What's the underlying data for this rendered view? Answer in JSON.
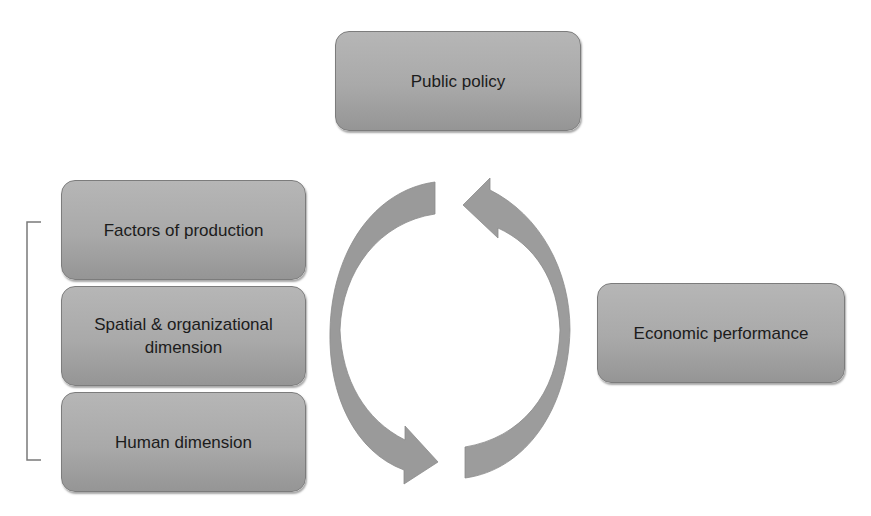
{
  "diagram": {
    "nodes": {
      "public_policy": "Public policy",
      "factors_of_production": "Factors of production",
      "spatial_organizational": "Spatial & organizational dimension",
      "human_dimension": "Human dimension",
      "economic_performance": "Economic performance"
    },
    "bracket_group": [
      "Factors of production",
      "Spatial & organizational dimension",
      "Human dimension"
    ],
    "cycle": {
      "arrows": [
        "left arrow: top to bottom (clockwise down)",
        "right arrow: bottom to top"
      ]
    },
    "colors": {
      "box_fill": "#a9a9a9",
      "box_border": "#7c7c7c",
      "arrow_light": "#a8a8a8",
      "arrow_dark": "#8a8a8a",
      "bracket": "#7a7a7a",
      "text": "#1c1c1c"
    }
  }
}
